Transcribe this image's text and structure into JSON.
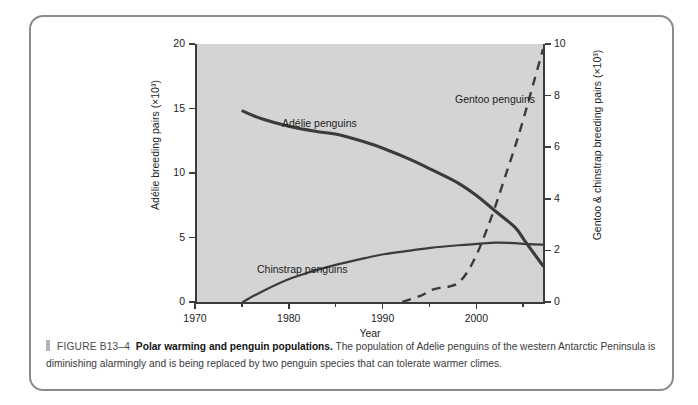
{
  "figure": {
    "marker_icon": "caption-marker-icon",
    "figure_number": "FIGURE B13–4",
    "title": "Polar warming and penguin populations.",
    "body": " The population of Adelie penguins of the western Antarctic Peninsula is diminishing alarmingly and is being replaced by two penguin species that can tolerate warmer climes."
  },
  "chart_data": {
    "type": "line",
    "title": "",
    "xlabel": "Year",
    "ylabel": "Adélie breeding pairs (×10³)",
    "ylabel_right": "Gentoo & chinstrap breeding pairs (×10³)",
    "xlim": [
      1970,
      2007
    ],
    "ylim": [
      0,
      20
    ],
    "ylim_right": [
      0,
      10
    ],
    "grid": false,
    "plot_background": "#d4d4d4",
    "line_color": "#3b3b3b",
    "legend_position": "inline-annotations",
    "xticks": [
      1970,
      1980,
      1990,
      2000
    ],
    "xtick_labels": [
      "1970",
      "1980",
      "1990",
      "2000"
    ],
    "xminor_ticks": [
      1975,
      1985,
      1995,
      2005
    ],
    "yticks_left": [
      0,
      5,
      10,
      15,
      20
    ],
    "ytick_labels_left": [
      "0",
      "5",
      "10",
      "15",
      "20"
    ],
    "yticks_right": [
      0,
      2,
      4,
      6,
      8,
      10
    ],
    "ytick_labels_right": [
      "0",
      "2",
      "4",
      "6",
      "8",
      "10"
    ],
    "series": [
      {
        "name": "Adélie penguins",
        "axis": "left",
        "style": "solid",
        "annotation": "Adélie penguins",
        "x": [
          1975,
          1977,
          1980,
          1983,
          1985,
          1988,
          1990,
          1993,
          1995,
          1998,
          2000,
          2002,
          2004,
          2005,
          2006,
          2007
        ],
        "y": [
          14.8,
          14.2,
          13.6,
          13.2,
          13.0,
          12.4,
          11.9,
          11.0,
          10.3,
          9.2,
          8.2,
          7.0,
          5.8,
          4.8,
          3.8,
          2.8
        ]
      },
      {
        "name": "Chinstrap penguins",
        "axis": "right",
        "style": "solid",
        "annotation": "Chinstrap penguins",
        "x": [
          1975,
          1977,
          1980,
          1983,
          1985,
          1988,
          1990,
          1993,
          1995,
          1998,
          2000,
          2002,
          2004,
          2005,
          2006,
          2007
        ],
        "y": [
          0.0,
          0.4,
          0.9,
          1.25,
          1.45,
          1.7,
          1.85,
          2.0,
          2.1,
          2.2,
          2.25,
          2.3,
          2.28,
          2.25,
          2.23,
          2.22
        ]
      },
      {
        "name": "Gentoo penguins",
        "axis": "right",
        "style": "dashed",
        "annotation": "Gentoo penguins",
        "x": [
          1992,
          1994,
          1995,
          1996,
          1997,
          1998,
          1999,
          2000,
          2001,
          2002,
          2003,
          2004,
          2005,
          2006,
          2007
        ],
        "y": [
          0.0,
          0.25,
          0.45,
          0.55,
          0.6,
          0.75,
          1.2,
          1.9,
          2.8,
          3.8,
          4.9,
          6.0,
          7.2,
          8.5,
          9.8
        ]
      }
    ]
  }
}
